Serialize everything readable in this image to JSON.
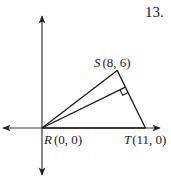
{
  "problem_number": "13.",
  "axes": {
    "x_range": [
      -5.5,
      16
    ],
    "y_range": [
      -6.5,
      15
    ]
  },
  "points": [
    {
      "id": "R",
      "name": "R",
      "coords": "(0, 0)",
      "x": 0,
      "y": 0
    },
    {
      "id": "S",
      "name": "S",
      "coords": "(8, 6)",
      "x": 8,
      "y": 6
    },
    {
      "id": "T",
      "name": "T",
      "coords": "(11, 0)",
      "x": 11,
      "y": 0
    }
  ],
  "segments": [
    [
      "R",
      "S"
    ],
    [
      "S",
      "T"
    ],
    [
      "T",
      "R"
    ]
  ],
  "altitude": {
    "from": "R",
    "to_segment": [
      "S",
      "T"
    ],
    "right_angle_mark": true
  },
  "colors": {
    "ink": "#1a1a1a",
    "axis": "#3a3a3a"
  }
}
